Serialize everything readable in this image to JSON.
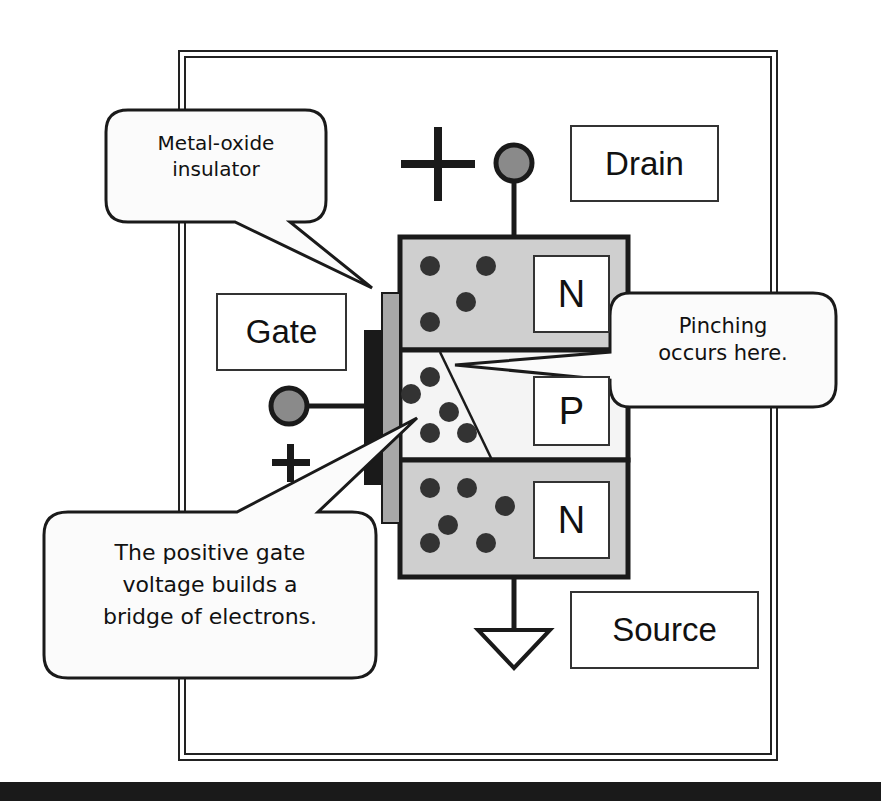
{
  "diagram": {
    "terminals": {
      "drain": "Drain",
      "gate": "Gate",
      "source": "Source"
    },
    "polarity": {
      "drain_sign": "+",
      "gate_sign": "+"
    },
    "regions": {
      "top": "N",
      "middle": "P",
      "bottom": "N"
    },
    "callouts": {
      "insulator": {
        "line1": "Metal-oxide",
        "line2": "insulator"
      },
      "pinching": {
        "line1": "Pinching",
        "line2": "occurs here."
      },
      "bridge": {
        "line1": "The positive gate",
        "line2": "voltage builds a",
        "line3": "bridge of electrons."
      }
    },
    "colors": {
      "n_region_fill": "#cfcfcf",
      "p_region_fill": "#f4f4f4",
      "insulator_fill": "#a8a8a8",
      "gate_metal_fill": "#1a1a1a",
      "electron_fill": "#333333",
      "terminal_fill": "#8a8a8a",
      "stroke": "#1a1a1a"
    }
  }
}
